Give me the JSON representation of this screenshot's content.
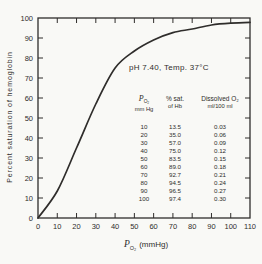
{
  "figure": {
    "annotation": "pH 7.40, Temp. 37°C",
    "y_title": "Percent saturation of hemoglobin",
    "x_title": {
      "symbol": "P",
      "sub": "O₂",
      "unit": "(mmHg)"
    },
    "ink_color": "#2f2d2b",
    "background_color": "#f9f9f6"
  },
  "table": {
    "col1": {
      "symbol": "P",
      "sub": "O₂",
      "unit": "mm Hg"
    },
    "col2": {
      "line1": "% sat.",
      "line2": "of Hb"
    },
    "col3": {
      "line1": "Dissolved O₂",
      "line2": "ml/100 ml"
    }
  },
  "chart_data": {
    "type": "line",
    "title": "",
    "annotation": "pH 7.40, Temp. 37°C",
    "xlabel": "PO₂ (mmHg)",
    "ylabel": "Percent saturation of hemoglobin",
    "xlim": [
      0,
      110
    ],
    "ylim": [
      0,
      100
    ],
    "x_tick_step": 10,
    "y_tick_step": 10,
    "grid": false,
    "legend": "none",
    "x": [
      0,
      10,
      20,
      30,
      40,
      50,
      60,
      70,
      80,
      90,
      100,
      110
    ],
    "series": [
      {
        "name": "Oxyhemoglobin dissociation curve (pH 7.40, 37°C)",
        "values": [
          0,
          13.5,
          35.0,
          57.0,
          75.0,
          83.5,
          89.0,
          92.7,
          94.5,
          96.5,
          97.4,
          97.8
        ]
      }
    ],
    "table": {
      "headers": [
        [
          "PO₂",
          "mm Hg"
        ],
        [
          "% sat.",
          "of Hb"
        ],
        [
          "Dissolved O₂",
          "ml/100 ml"
        ]
      ],
      "rows": [
        [
          "10",
          "13.5",
          "0.03"
        ],
        [
          "20",
          "35.0",
          "0.06"
        ],
        [
          "30",
          "57.0",
          "0.09"
        ],
        [
          "40",
          "75.0",
          "0.12"
        ],
        [
          "50",
          "83.5",
          "0.15"
        ],
        [
          "60",
          "89.0",
          "0.18"
        ],
        [
          "70",
          "92.7",
          "0.21"
        ],
        [
          "80",
          "94.5",
          "0.24"
        ],
        [
          "90",
          "96.5",
          "0.27"
        ],
        [
          "100",
          "97.4",
          "0.30"
        ]
      ]
    }
  }
}
